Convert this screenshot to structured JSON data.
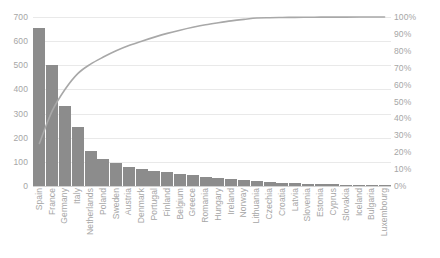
{
  "chart_data": {
    "type": "bar",
    "title": "",
    "subtitle": "",
    "xlabel": "",
    "ylabel": "",
    "y2label": "",
    "grid": true,
    "legend": false,
    "ylim": [
      0,
      700
    ],
    "y2lim": [
      0,
      100
    ],
    "y_ticks": [
      "0",
      "100",
      "200",
      "300",
      "400",
      "500",
      "600",
      "700"
    ],
    "y_tick_values": [
      0,
      100,
      200,
      300,
      400,
      500,
      600,
      700
    ],
    "y2_ticks": [
      "0%",
      "10%",
      "20%",
      "30%",
      "40%",
      "50%",
      "60%",
      "70%",
      "80%",
      "90%",
      "100%"
    ],
    "y2_tick_values": [
      0,
      10,
      20,
      30,
      40,
      50,
      60,
      70,
      80,
      90,
      100
    ],
    "categories": [
      "Spain",
      "France",
      "Germany",
      "Italy",
      "Netherlands",
      "Poland",
      "Sweden",
      "Austria",
      "Denmark",
      "Portugal",
      "Finland",
      "Belgium",
      "Greece",
      "Romania",
      "Hungary",
      "Ireland",
      "Norway",
      "Lithuania",
      "Czechia",
      "Croatia",
      "Latvia",
      "Slovenia",
      "Estonia",
      "Cyprus",
      "Slovakia",
      "Iceland",
      "Bulgaria",
      "Luxembourg"
    ],
    "series": [
      {
        "name": "Count",
        "type": "bar",
        "axis": "left",
        "color": "#8c8c8c",
        "values": [
          655,
          500,
          330,
          245,
          145,
          110,
          95,
          80,
          70,
          62,
          56,
          50,
          44,
          38,
          33,
          28,
          24,
          20,
          17,
          14,
          12,
          10,
          8,
          7,
          5,
          4,
          3,
          2
        ]
      },
      {
        "name": "Cumulative %",
        "type": "line",
        "axis": "right",
        "color": "#a8a8a8",
        "values": [
          25.2,
          44.4,
          57.1,
          66.5,
          72.1,
          76.3,
          80.0,
          83.1,
          85.7,
          88.1,
          90.3,
          92.2,
          93.9,
          95.4,
          96.6,
          97.7,
          98.6,
          99.4,
          99.6,
          99.7,
          99.8,
          99.85,
          99.9,
          99.92,
          99.95,
          99.97,
          99.99,
          100.0
        ]
      }
    ]
  },
  "colors": {
    "bar": "#8c8c8c",
    "line": "#a8a8a8",
    "grid": "#e9e9e9",
    "baseline": "#d2d2d2",
    "text": "#a6a6a6",
    "background": "#ffffff"
  }
}
